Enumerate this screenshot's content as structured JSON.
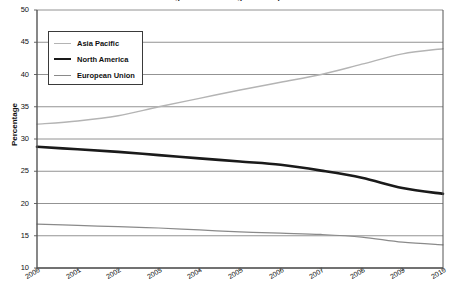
{
  "chart_data": {
    "type": "line",
    "title": "Regional share of global output",
    "xlabel": "",
    "ylabel": "Percentage",
    "x": [
      2000,
      2001,
      2002,
      2003,
      2004,
      2005,
      2006,
      2007,
      2008,
      2009,
      2010
    ],
    "xtick_labels": [
      "2000",
      "2001",
      "2002",
      "2003",
      "2004",
      "2005",
      "2006",
      "2007",
      "2008",
      "2009",
      "2010"
    ],
    "ytick_labels": [
      "10",
      "15",
      "20",
      "25",
      "30",
      "35",
      "40",
      "45",
      "50"
    ],
    "yticks": [
      10,
      15,
      20,
      25,
      30,
      35,
      40,
      45,
      50
    ],
    "ylim": [
      10,
      50
    ],
    "xlim": [
      2000,
      2010
    ],
    "grid": "horizontal",
    "legend_position": "top-left-inside",
    "series": [
      {
        "name": "Asia Pacific",
        "color": "#b4b4b4",
        "width": 1.4,
        "values": [
          32.3,
          32.8,
          33.6,
          35.0,
          36.3,
          37.6,
          38.8,
          40.0,
          41.6,
          43.2,
          44.0
        ]
      },
      {
        "name": "North America",
        "color": "#1a1a1a",
        "width": 2.6,
        "values": [
          28.8,
          28.4,
          28.0,
          27.5,
          27.0,
          26.5,
          26.0,
          25.1,
          24.0,
          22.4,
          21.5
        ]
      },
      {
        "name": "European Union",
        "color": "#8a8a8a",
        "width": 1.2,
        "values": [
          16.8,
          16.6,
          16.4,
          16.2,
          15.9,
          15.6,
          15.4,
          15.2,
          14.8,
          14.0,
          13.6
        ]
      }
    ]
  },
  "colors": {
    "axis": "#555555",
    "gridline": "#777777",
    "background": "#ffffff",
    "text": "#111111"
  }
}
